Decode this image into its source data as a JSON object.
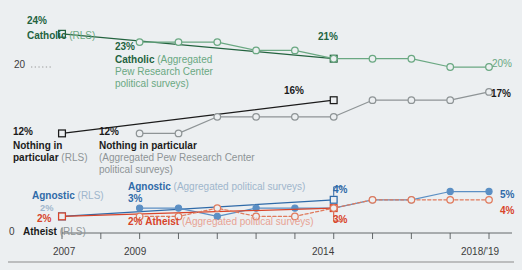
{
  "chart_data": {
    "type": "line",
    "title": "",
    "xlabel": "",
    "ylabel": "",
    "xlim": [
      2007,
      2019
    ],
    "ylim": [
      0,
      26
    ],
    "grid": false,
    "legend_position": "inline-annotations",
    "y_axis_ticks": [
      "20",
      "0"
    ],
    "x_axis_ticks": [
      "2007",
      "2009",
      "2014",
      "2018/'19"
    ],
    "x_tick_years": [
      2007,
      2008,
      2009,
      2010,
      2011,
      2012,
      2013,
      2014,
      2015,
      2016,
      2017,
      2018
    ],
    "series": [
      {
        "name": "Catholic (RLS)",
        "color": "#23633f",
        "marker": "square",
        "x": [
          2007,
          2014
        ],
        "values": [
          24,
          21
        ],
        "start_label": "24%",
        "end_label": "21%"
      },
      {
        "name": "Catholic (Aggregated Pew Research Center political surveys)",
        "color": "#6aa882",
        "marker": "circle",
        "x": [
          2009,
          2010,
          2011,
          2012,
          2013,
          2014,
          2015,
          2016,
          2017,
          2018
        ],
        "values": [
          23,
          23,
          23,
          22,
          22,
          21,
          21,
          21,
          20,
          20
        ],
        "start_label": "23%",
        "end_label": "20%"
      },
      {
        "name": "Nothing in particular (RLS)",
        "color": "#1b1b1b",
        "marker": "square",
        "x": [
          2007,
          2014
        ],
        "values": [
          12,
          16
        ],
        "start_label": "12%",
        "end_label": "16%"
      },
      {
        "name": "Nothing in particular (Aggregated Pew Research Center political surveys)",
        "color": "#8e9496",
        "marker": "circle",
        "x": [
          2009,
          2010,
          2011,
          2012,
          2013,
          2014,
          2015,
          2016,
          2017,
          2018
        ],
        "values": [
          12,
          12,
          14,
          14,
          14,
          14,
          16,
          16,
          16,
          17
        ],
        "start_label": "12%",
        "end_label": "17%"
      },
      {
        "name": "Agnostic (RLS)",
        "color": "#2f6aa8",
        "marker": "square",
        "x": [
          2007,
          2014
        ],
        "values": [
          2,
          4
        ],
        "start_label": "2%",
        "end_label": "4%"
      },
      {
        "name": "Agnostic (Aggregated political surveys)",
        "color": "#5b8fc4",
        "marker": "circle-filled",
        "x": [
          2009,
          2010,
          2011,
          2012,
          2013,
          2014,
          2015,
          2016,
          2017,
          2018
        ],
        "values": [
          3,
          3,
          2,
          3,
          3,
          3,
          4,
          4,
          5,
          5
        ],
        "start_label": "3%",
        "end_label": "5%"
      },
      {
        "name": "Atheist (RLS)",
        "color": "#d8442a",
        "marker": "square",
        "x": [
          2007,
          2014
        ],
        "values": [
          2,
          3
        ],
        "start_label": "2%",
        "end_label": "3%"
      },
      {
        "name": "Atheist (Aggregated political surveys)",
        "color": "#e07a5c",
        "marker": "circle",
        "x": [
          2009,
          2010,
          2011,
          2012,
          2013,
          2014,
          2015,
          2016,
          2017,
          2018
        ],
        "values": [
          2,
          2,
          3,
          2,
          2,
          3,
          4,
          4,
          4,
          4
        ],
        "start_label": "2%",
        "end_label": "4%"
      }
    ]
  },
  "annotations": {
    "catholic_rls": {
      "value": "24%",
      "name": "Catholic",
      "source": "(RLS)"
    },
    "catholic_agg": {
      "value": "23%",
      "name": "Catholic",
      "source_l1": "(Aggregated",
      "source_l2": "Pew Research Center",
      "source_l3": "political surveys)"
    },
    "catholic_rls_end": "21%",
    "catholic_agg_end": "20%",
    "nothing_rls": {
      "value": "12%",
      "name_l1": "Nothing in",
      "name_l2": "particular",
      "source": "(RLS)"
    },
    "nothing_agg": {
      "value": "12%",
      "name": "Nothing in particular",
      "source_l1": "(Aggregated Pew Research Center",
      "source_l2": "political surveys)"
    },
    "nothing_rls_end": "16%",
    "nothing_agg_end": "17%",
    "agnostic_rls": {
      "value": "2%",
      "name": "Agnostic",
      "source": "(RLS)"
    },
    "agnostic_agg": {
      "value": "3%",
      "name": "Agnostic",
      "source": "(Aggregated political surveys)"
    },
    "agnostic_rls_end": "4%",
    "agnostic_agg_end": "5%",
    "atheist_rls": {
      "value": "2%",
      "name": "Atheist",
      "source": "(RLS)"
    },
    "atheist_agg": {
      "value": "2%",
      "name": "Atheist",
      "source": "(Aggregated political surveys)"
    },
    "atheist_rls_end": "3%",
    "atheist_agg_end": "4%"
  },
  "axis": {
    "y_top": "20",
    "y_zero": "0",
    "x_2007": "2007",
    "x_2009": "2009",
    "x_2014": "2014",
    "x_2018": "2018/'19"
  }
}
